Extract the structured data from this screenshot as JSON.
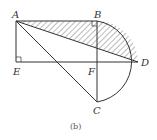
{
  "diagram": {
    "caption": "(b)",
    "points": {
      "A": {
        "label": "A",
        "x": 16,
        "y": 21
      },
      "B": {
        "label": "B",
        "x": 97,
        "y": 21
      },
      "C": {
        "label": "C",
        "x": 97,
        "y": 102
      },
      "D": {
        "label": "D",
        "x": 138,
        "y": 62
      },
      "E": {
        "label": "E",
        "x": 16,
        "y": 62
      },
      "F": {
        "label": "F",
        "x": 97,
        "y": 62
      }
    },
    "segments": [
      "AB",
      "AE",
      "ED",
      "AD",
      "AC",
      "BC"
    ],
    "arc": {
      "center": "F",
      "from": "B",
      "through": "D",
      "to": "C"
    },
    "right_angles": [
      "E",
      "B"
    ],
    "shaded_region": "region bounded by AB, arc BD, and DA (hatched)",
    "colors": {
      "stroke": "#333333",
      "hatch": "#555555"
    }
  }
}
